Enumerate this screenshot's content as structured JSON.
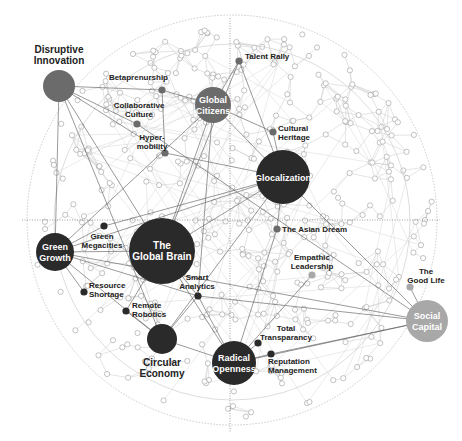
{
  "diagram": {
    "type": "network-map",
    "guides": {
      "outer_ring": {
        "cx": 232,
        "cy": 220,
        "r": 205
      },
      "inner_ring": {
        "cx": 232,
        "cy": 222,
        "r": 178
      },
      "vertical_axis": {
        "x": 230,
        "y1": 18,
        "y2": 432
      },
      "horizontal_axis": {
        "y": 220,
        "x1": 22,
        "x2": 440
      }
    },
    "colors": {
      "dark": "#2a2a2a",
      "mid": "#6b6b6b",
      "light": "#a8a8a8",
      "edge_strong": "#555555",
      "edge_faint": "#c8c8c8",
      "minor_node_stroke": "#9a9a9a"
    },
    "megatrends": [
      {
        "id": "disruptive-innovation",
        "label_lines": [
          "Disruptive",
          "Innovation"
        ],
        "cx": 59,
        "cy": 86,
        "r": 16,
        "tone": "mid",
        "label_pos": "above"
      },
      {
        "id": "global-citizens",
        "label_lines": [
          "Global",
          "Citizens"
        ],
        "cx": 213,
        "cy": 105,
        "r": 18,
        "tone": "mid",
        "label_pos": "inside"
      },
      {
        "id": "glocalization",
        "label_lines": [
          "Glocalization"
        ],
        "cx": 283,
        "cy": 177,
        "r": 27,
        "tone": "dark",
        "label_pos": "inside"
      },
      {
        "id": "the-global-brain",
        "label_lines": [
          "The",
          "Global Brain"
        ],
        "cx": 162,
        "cy": 251,
        "r": 33,
        "tone": "dark",
        "label_pos": "inside"
      },
      {
        "id": "green-growth",
        "label_lines": [
          "Green",
          "Growth"
        ],
        "cx": 55,
        "cy": 252,
        "r": 19,
        "tone": "dark",
        "label_pos": "inside"
      },
      {
        "id": "circular-economy",
        "label_lines": [
          "Circular",
          "Economy"
        ],
        "cx": 162,
        "cy": 339,
        "r": 15,
        "tone": "dark",
        "label_pos": "below"
      },
      {
        "id": "radical-openness",
        "label_lines": [
          "Radical",
          "Openness"
        ],
        "cx": 234,
        "cy": 363,
        "r": 22,
        "tone": "dark",
        "label_pos": "inside"
      },
      {
        "id": "social-capital",
        "label_lines": [
          "Social",
          "Capital"
        ],
        "cx": 427,
        "cy": 321,
        "r": 21,
        "tone": "light",
        "label_pos": "inside"
      }
    ],
    "trends": [
      {
        "id": "betaprenurship",
        "label_lines": [
          "Betaprenurship"
        ],
        "cx": 162,
        "cy": 90,
        "tone": "mid",
        "anchor": "end",
        "lx": 168,
        "ly": 80
      },
      {
        "id": "collaborative-culture",
        "label_lines": [
          "Collaborative",
          "Culture"
        ],
        "cx": 137,
        "cy": 124,
        "tone": "mid",
        "anchor": "middle",
        "lx": 139,
        "ly": 108
      },
      {
        "id": "hyper-mobility",
        "label_lines": [
          "Hyper-",
          "mobility"
        ],
        "cx": 165,
        "cy": 153,
        "tone": "mid",
        "anchor": "middle",
        "lx": 152,
        "ly": 140
      },
      {
        "id": "talent-rally",
        "label_lines": [
          "Talent Rally"
        ],
        "cx": 239,
        "cy": 61,
        "tone": "mid",
        "anchor": "start",
        "lx": 245,
        "ly": 59
      },
      {
        "id": "cultural-heritage",
        "label_lines": [
          "Cultural",
          "Heritage"
        ],
        "cx": 273,
        "cy": 132,
        "tone": "mid",
        "anchor": "start",
        "lx": 278,
        "ly": 131
      },
      {
        "id": "green-megacities",
        "label_lines": [
          "Green",
          "Megacities"
        ],
        "cx": 104,
        "cy": 226,
        "tone": "dark",
        "anchor": "middle",
        "lx": 102,
        "ly": 239
      },
      {
        "id": "the-asian-dream",
        "label_lines": [
          "The Asian Dream"
        ],
        "cx": 277,
        "cy": 229,
        "tone": "mid",
        "anchor": "start",
        "lx": 282,
        "ly": 232
      },
      {
        "id": "empathic-leadership",
        "label_lines": [
          "Empathic",
          "Leadership"
        ],
        "cx": 312,
        "cy": 275,
        "tone": "light",
        "anchor": "middle",
        "lx": 312,
        "ly": 260
      },
      {
        "id": "the-good-life",
        "label_lines": [
          "The",
          "Good Life"
        ],
        "cx": 410,
        "cy": 287,
        "tone": "light",
        "anchor": "middle",
        "lx": 426,
        "ly": 274
      },
      {
        "id": "resource-shortage",
        "label_lines": [
          "Resource",
          "Shortage"
        ],
        "cx": 84,
        "cy": 292,
        "tone": "dark",
        "anchor": "start",
        "lx": 89,
        "ly": 288
      },
      {
        "id": "smart-analytics",
        "label_lines": [
          "Smart",
          "Analytics"
        ],
        "cx": 198,
        "cy": 296,
        "tone": "dark",
        "anchor": "middle",
        "lx": 197,
        "ly": 280
      },
      {
        "id": "remote-robotics",
        "label_lines": [
          "Remote",
          "Robotics"
        ],
        "cx": 126,
        "cy": 311,
        "tone": "dark",
        "anchor": "start",
        "lx": 132,
        "ly": 308
      },
      {
        "id": "total-transparancy",
        "label_lines": [
          "Total",
          "Transparancy"
        ],
        "cx": 258,
        "cy": 343,
        "tone": "dark",
        "anchor": "middle",
        "lx": 286,
        "ly": 331
      },
      {
        "id": "reputation-management",
        "label_lines": [
          "Reputation",
          "Management"
        ],
        "cx": 271,
        "cy": 354,
        "tone": "dark",
        "anchor": "start",
        "lx": 268,
        "ly": 364
      }
    ],
    "strong_edges": [
      [
        "disruptive-innovation",
        "betaprenurship"
      ],
      [
        "disruptive-innovation",
        "collaborative-culture"
      ],
      [
        "disruptive-innovation",
        "circular-economy"
      ],
      [
        "disruptive-innovation",
        "the-global-brain"
      ],
      [
        "disruptive-innovation",
        "green-growth"
      ],
      [
        "disruptive-innovation",
        "hyper-mobility"
      ],
      [
        "betaprenurship",
        "global-citizens"
      ],
      [
        "betaprenurship",
        "hyper-mobility"
      ],
      [
        "talent-rally",
        "global-citizens"
      ],
      [
        "talent-rally",
        "glocalization"
      ],
      [
        "talent-rally",
        "the-global-brain"
      ],
      [
        "global-citizens",
        "the-global-brain"
      ],
      [
        "global-citizens",
        "glocalization"
      ],
      [
        "global-citizens",
        "green-growth"
      ],
      [
        "global-citizens",
        "smart-analytics"
      ],
      [
        "cultural-heritage",
        "glocalization"
      ],
      [
        "cultural-heritage",
        "global-citizens"
      ],
      [
        "glocalization",
        "the-global-brain"
      ],
      [
        "glocalization",
        "green-growth"
      ],
      [
        "glocalization",
        "the-asian-dream"
      ],
      [
        "glocalization",
        "social-capital"
      ],
      [
        "glocalization",
        "green-megacities"
      ],
      [
        "glocalization",
        "circular-economy"
      ],
      [
        "the-global-brain",
        "smart-analytics"
      ],
      [
        "the-global-brain",
        "green-growth"
      ],
      [
        "the-global-brain",
        "radical-openness"
      ],
      [
        "green-growth",
        "green-megacities"
      ],
      [
        "green-growth",
        "resource-shortage"
      ],
      [
        "green-growth",
        "circular-economy"
      ],
      [
        "green-growth",
        "smart-analytics"
      ],
      [
        "green-growth",
        "social-capital"
      ],
      [
        "smart-analytics",
        "radical-openness"
      ],
      [
        "smart-analytics",
        "circular-economy"
      ],
      [
        "smart-analytics",
        "social-capital"
      ],
      [
        "remote-robotics",
        "the-global-brain"
      ],
      [
        "remote-robotics",
        "circular-economy"
      ],
      [
        "the-asian-dream",
        "radical-openness"
      ],
      [
        "empathic-leadership",
        "radical-openness"
      ],
      [
        "the-good-life",
        "social-capital"
      ],
      [
        "radical-openness",
        "social-capital"
      ],
      [
        "radical-openness",
        "total-transparancy"
      ],
      [
        "radical-openness",
        "reputation-management"
      ],
      [
        "reputation-management",
        "social-capital"
      ],
      [
        "circular-economy",
        "radical-openness"
      ],
      [
        "hyper-mobility",
        "glocalization"
      ],
      [
        "collaborative-culture",
        "social-capital"
      ]
    ]
  }
}
